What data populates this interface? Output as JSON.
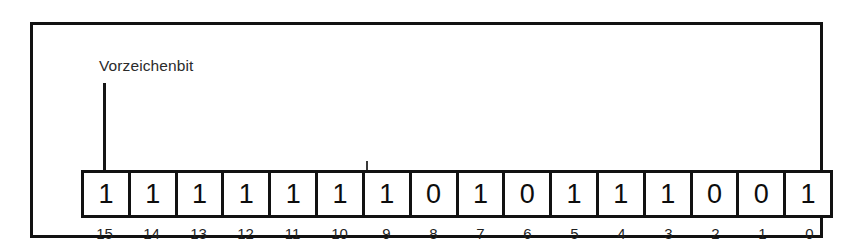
{
  "figure": {
    "title": "Vorzeichenbit",
    "frame_color": "#111111",
    "background_color": "#ffffff",
    "text_color": "#1a1a1a"
  },
  "annotation": {
    "label": "Vorzeichenbit",
    "points_to_bit_index": "15",
    "leader_line_color": "#151515"
  },
  "register": {
    "bit_width": 16,
    "msb_first": true,
    "bits": [
      {
        "index": "15",
        "value": "1"
      },
      {
        "index": "14",
        "value": "1"
      },
      {
        "index": "13",
        "value": "1"
      },
      {
        "index": "12",
        "value": "1"
      },
      {
        "index": "11",
        "value": "1"
      },
      {
        "index": "10",
        "value": "1"
      },
      {
        "index": "9",
        "value": "1"
      },
      {
        "index": "8",
        "value": "0"
      },
      {
        "index": "7",
        "value": "1"
      },
      {
        "index": "6",
        "value": "0"
      },
      {
        "index": "5",
        "value": "1"
      },
      {
        "index": "4",
        "value": "1"
      },
      {
        "index": "3",
        "value": "1"
      },
      {
        "index": "2",
        "value": "0"
      },
      {
        "index": "1",
        "value": "0"
      },
      {
        "index": "0",
        "value": "1"
      }
    ]
  }
}
